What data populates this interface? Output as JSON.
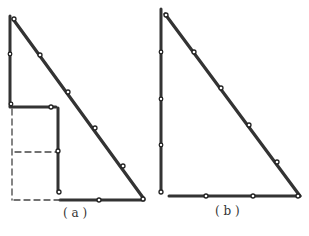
{
  "figures": [
    {
      "id": "a",
      "label": "( a )",
      "description": "Right triangle made of hinged rods, with the vertical and horizontal legs folded into an inner rectangle; dashed lines show the original square area",
      "line_color": "#333333",
      "dash_color": "#444444"
    },
    {
      "id": "b",
      "label": "( b )",
      "description": "Right triangle made of 12 hinged rod segments (3-4-5 proportions)",
      "line_color": "#333333"
    }
  ]
}
